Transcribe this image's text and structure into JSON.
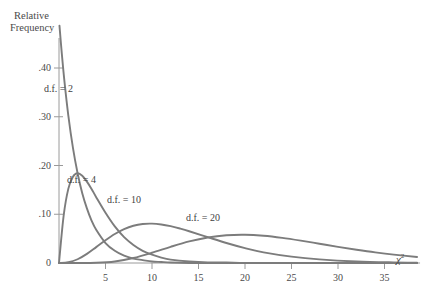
{
  "figure": {
    "background_color": "#ffffff",
    "curve_color": "#7c7c7c",
    "axis_color": "#9a9a9a",
    "text_color": "#4a4a4a"
  },
  "axes": {
    "y_title_line1": "Relative",
    "y_title_line2": "Frequency",
    "x_symbol_base": "χ",
    "x_symbol_exponent": "2",
    "y_ticks": [
      ".40",
      ".30",
      ".20",
      ".10",
      "0"
    ],
    "x_ticks": [
      "5",
      "10",
      "15",
      "20",
      "25",
      "30",
      "35"
    ]
  },
  "curve_labels": [
    {
      "text": "d.f. = 2",
      "left": 44,
      "top": 83
    },
    {
      "text": "d.f. = 4",
      "left": 67,
      "top": 174
    },
    {
      "text": "d.f. = 10",
      "left": 107,
      "top": 194
    },
    {
      "text": "d.f. = 20",
      "left": 186,
      "top": 212
    }
  ],
  "chart_data": {
    "type": "line",
    "title": "",
    "subtitle": "",
    "xlabel": "χ²",
    "ylabel": "Relative Frequency",
    "xlim": [
      0,
      38.5
    ],
    "ylim": [
      0,
      0.47
    ],
    "xticks": [
      5,
      10,
      15,
      20,
      25,
      30,
      35
    ],
    "xticklabels": [
      "5",
      "10",
      "15",
      "20",
      "25",
      "30",
      "35"
    ],
    "yticks": [
      0.0,
      0.1,
      0.2,
      0.3,
      0.4
    ],
    "yticklabels": [
      "0",
      ".10",
      ".20",
      ".30",
      ".40"
    ],
    "grid": false,
    "legend": "inline-annotations",
    "series": [
      {
        "name": "d.f. = 2",
        "df": 2,
        "annotation": "d.f. = 2",
        "peak_x": 0.0,
        "peak_y": 0.5,
        "x": [
          0.05,
          0.3,
          0.6,
          1,
          1.5,
          2,
          2.5,
          3,
          3.5,
          4,
          5,
          6,
          7,
          8,
          9,
          10,
          11,
          12,
          14,
          16,
          18,
          20,
          24,
          28,
          32,
          36,
          38.5
        ],
        "y": [
          0.487,
          0.43,
          0.37,
          0.303,
          0.236,
          0.184,
          0.143,
          0.112,
          0.087,
          0.068,
          0.041,
          0.025,
          0.015,
          0.009,
          0.006,
          0.003,
          0.002,
          0.001,
          0.0,
          0.0,
          0.0,
          0.0,
          0.0,
          0.0,
          0.0,
          0.0,
          0.0
        ]
      },
      {
        "name": "d.f. = 4",
        "df": 4,
        "annotation": "d.f. = 4",
        "peak_x": 2.0,
        "peak_y": 0.184,
        "x": [
          0,
          0.5,
          1,
          1.5,
          2,
          2.5,
          3,
          3.5,
          4,
          5,
          6,
          7,
          8,
          9,
          10,
          11,
          12,
          14,
          16,
          18,
          20,
          24,
          28,
          32,
          36,
          38.5
        ],
        "y": [
          0.0,
          0.097,
          0.152,
          0.177,
          0.184,
          0.179,
          0.167,
          0.152,
          0.135,
          0.103,
          0.075,
          0.053,
          0.037,
          0.025,
          0.017,
          0.011,
          0.007,
          0.003,
          0.001,
          0.001,
          0.0,
          0.0,
          0.0,
          0.0,
          0.0,
          0.0
        ]
      },
      {
        "name": "d.f. = 10",
        "df": 10,
        "annotation": "d.f. = 10",
        "peak_x": 8.0,
        "peak_y": 0.098,
        "x": [
          0,
          1,
          2,
          3,
          4,
          5,
          6,
          7,
          8,
          9,
          10,
          11,
          12,
          13,
          14,
          16,
          18,
          20,
          22,
          25,
          28,
          32,
          36,
          38.5
        ],
        "y": [
          0.0,
          0.0016,
          0.0077,
          0.0187,
          0.0326,
          0.0467,
          0.0594,
          0.0695,
          0.0764,
          0.08,
          0.0807,
          0.079,
          0.0755,
          0.0707,
          0.0652,
          0.053,
          0.041,
          0.0305,
          0.0219,
          0.0131,
          0.0074,
          0.0031,
          0.0012,
          0.0007
        ]
      },
      {
        "name": "d.f. = 20",
        "df": 20,
        "annotation": "d.f. = 20",
        "peak_x": 18.0,
        "peak_y": 0.0625,
        "x": [
          0,
          2,
          4,
          6,
          8,
          10,
          12,
          14,
          16,
          18,
          20,
          22,
          24,
          26,
          28,
          30,
          32,
          34,
          36,
          38.5
        ],
        "y": [
          0.0,
          0.0,
          0.0005,
          0.0032,
          0.0103,
          0.021,
          0.0332,
          0.0442,
          0.0524,
          0.057,
          0.058,
          0.0559,
          0.0516,
          0.0459,
          0.0395,
          0.0331,
          0.0271,
          0.0217,
          0.0171,
          0.0124
        ]
      }
    ]
  }
}
